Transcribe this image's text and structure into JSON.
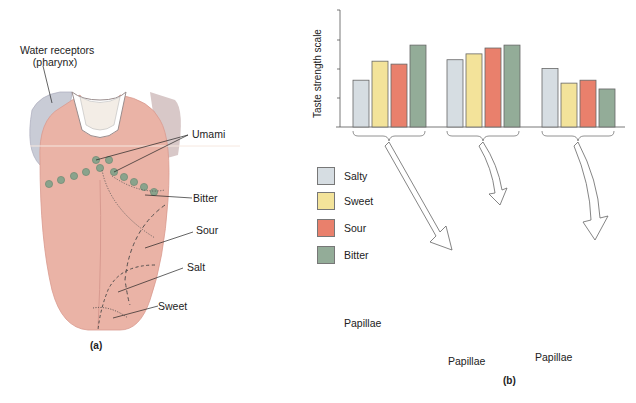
{
  "panel_a": {
    "label": "(a)",
    "callouts": {
      "water_receptors_line1": "Water receptors",
      "water_receptors_line2": "(pharynx)",
      "umami": "Umami",
      "bitter": "Bitter",
      "sour": "Sour",
      "salt": "Salt",
      "sweet": "Sweet"
    }
  },
  "panel_b": {
    "label": "(b)",
    "callouts": {
      "papillae_left": "Papillae",
      "papillae_bottom": "Papillae",
      "papillae_right": "Papillae"
    },
    "legend": [
      {
        "label": "Salty",
        "color": "#d6dde2"
      },
      {
        "label": "Sweet",
        "color": "#f3e39a"
      },
      {
        "label": "Sour",
        "color": "#e9806c"
      },
      {
        "label": "Bitter",
        "color": "#93ac98"
      }
    ]
  },
  "chart_data": {
    "type": "bar",
    "title": "",
    "xlabel": "",
    "ylabel": "Taste strength scale",
    "ylim": [
      0,
      4
    ],
    "y_ticks_labeled": false,
    "grid": false,
    "categories": [
      "Circumvallate papillae (back)",
      "Foliate papillae (sides)",
      "Fungiform papillae (tip)"
    ],
    "series": [
      {
        "name": "Salty",
        "color": "#d6dde2",
        "values": [
          1.6,
          2.3,
          2.0
        ]
      },
      {
        "name": "Sweet",
        "color": "#f3e39a",
        "values": [
          2.25,
          2.5,
          1.5
        ]
      },
      {
        "name": "Sour",
        "color": "#e9806c",
        "values": [
          2.15,
          2.7,
          1.6
        ]
      },
      {
        "name": "Bitter",
        "color": "#93ac98",
        "values": [
          2.8,
          2.8,
          1.3
        ]
      }
    ],
    "legend_position": "left, below chart"
  },
  "colors": {
    "tongue": "#eab3a6",
    "tongue_dark": "#d98f84",
    "papilla_green": "#8aa38c",
    "pharynx_gray": "#c9ccd6",
    "axis": "#555555"
  }
}
